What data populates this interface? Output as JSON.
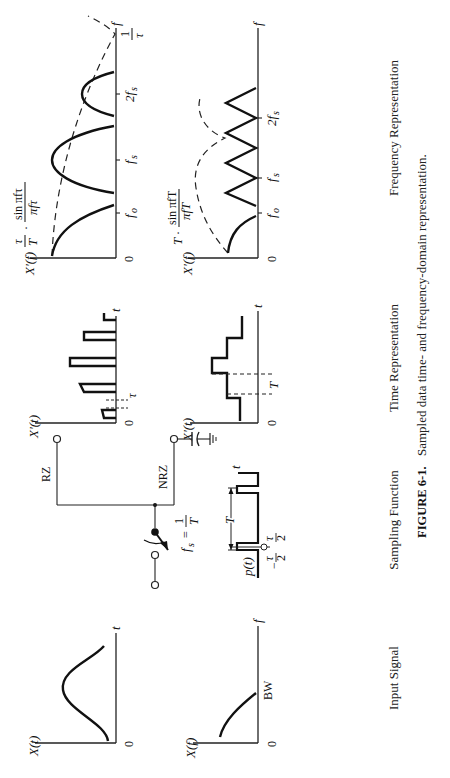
{
  "figure": {
    "number": "FIGURE 6-1.",
    "caption": "Sampled data time- and frequency-domain representation.",
    "orientation": "rotated 90° counter-clockwise on page"
  },
  "columns": {
    "input": "Input Signal",
    "sampling": "Sampling Function",
    "time": "Time Representation",
    "frequency": "Frequency Representation"
  },
  "input_time": {
    "ylabel": "X(t)",
    "xlabel": "t",
    "origin": "0"
  },
  "input_freq": {
    "ylabel": "X(f)",
    "xlabel": "f",
    "origin": "0",
    "marker": "BW"
  },
  "sampling": {
    "rz": "RZ",
    "nrz": "NRZ",
    "rate_lhs": "f",
    "rate_sub": "s",
    "rate_eq": "=",
    "rate_num": "1",
    "rate_den": "T",
    "pulse_label": "p(t)",
    "period": "T",
    "pulse_lo": "−",
    "tau": "τ",
    "two": "2",
    "t_axis": "t"
  },
  "rz_time": {
    "ylabel": "X′(t)",
    "xlabel": "t",
    "origin": "0",
    "width": "τ"
  },
  "nrz_time": {
    "ylabel": "X′(t)",
    "xlabel": "t",
    "origin": "0",
    "width": "T"
  },
  "rz_freq": {
    "ylabel": "X′(f)",
    "xlabel": "f",
    "origin": "0",
    "ticks": [
      "f",
      "f",
      "2f"
    ],
    "tick_subs": [
      "o",
      "s",
      "s"
    ],
    "zero_num": "1",
    "zero_den": "τ",
    "env_a_num": "τ",
    "env_a_den": "T",
    "dot": "·",
    "env_b_num": "sin πfτ",
    "env_b_den": "πfτ"
  },
  "nrz_freq": {
    "ylabel": "X′(f)",
    "xlabel": "f",
    "origin": "0",
    "ticks": [
      "f",
      "f",
      "2f"
    ],
    "tick_subs": [
      "o",
      "s",
      "s"
    ],
    "env_a": "T",
    "dot": "·",
    "env_b_num": "sin πfT",
    "env_b_den": "πfT"
  }
}
